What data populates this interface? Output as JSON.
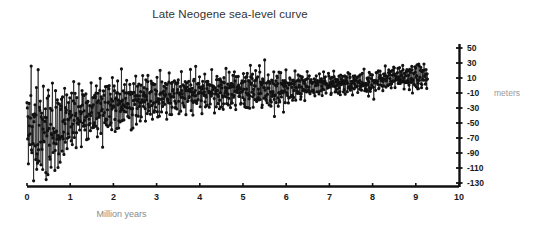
{
  "chart_data": {
    "type": "line",
    "title": "Late Neogene sea-level curve",
    "xlabel": "Million years",
    "ylabel": "meters",
    "xlim": [
      0,
      10
    ],
    "ylim": [
      -130,
      55
    ],
    "xticks": [
      0,
      1,
      2,
      3,
      4,
      5,
      6,
      7,
      8,
      9,
      10
    ],
    "xtick_labels": [
      "0",
      "1",
      "2",
      "3",
      "4",
      "5",
      "6",
      "7",
      "8",
      "9",
      "10"
    ],
    "yticks": [
      50,
      30,
      10,
      -10,
      -30,
      -50,
      -70,
      -90,
      -110,
      -130
    ],
    "ytick_labels": [
      "50",
      "30",
      "10",
      "-10",
      "-30",
      "-50",
      "-70",
      "-90",
      "-110",
      "-130"
    ],
    "grid": false,
    "legend": null,
    "series_color": "#111111",
    "marker": "circle",
    "marker_size": 1.6,
    "line_width": 0.7,
    "data_x_range": [
      0.0,
      9.27
    ],
    "envelope": [
      {
        "x": 0.0,
        "mean": -55,
        "amp": 72
      },
      {
        "x": 0.25,
        "mean": -58,
        "amp": 75
      },
      {
        "x": 0.5,
        "mean": -62,
        "amp": 70
      },
      {
        "x": 0.75,
        "mean": -58,
        "amp": 62
      },
      {
        "x": 1.0,
        "mean": -45,
        "amp": 50
      },
      {
        "x": 1.25,
        "mean": -40,
        "amp": 44
      },
      {
        "x": 1.5,
        "mean": -36,
        "amp": 42
      },
      {
        "x": 1.75,
        "mean": -30,
        "amp": 40
      },
      {
        "x": 2.0,
        "mean": -26,
        "amp": 38
      },
      {
        "x": 2.5,
        "mean": -20,
        "amp": 36
      },
      {
        "x": 3.0,
        "mean": -16,
        "amp": 34
      },
      {
        "x": 3.5,
        "mean": -10,
        "amp": 30
      },
      {
        "x": 4.0,
        "mean": -8,
        "amp": 30
      },
      {
        "x": 4.5,
        "mean": -8,
        "amp": 28
      },
      {
        "x": 5.0,
        "mean": -6,
        "amp": 28
      },
      {
        "x": 5.35,
        "mean": 0,
        "amp": 34
      },
      {
        "x": 5.75,
        "mean": -8,
        "amp": 30
      },
      {
        "x": 6.0,
        "mean": -4,
        "amp": 26
      },
      {
        "x": 6.5,
        "mean": 0,
        "amp": 18
      },
      {
        "x": 7.0,
        "mean": 2,
        "amp": 16
      },
      {
        "x": 7.5,
        "mean": 3,
        "amp": 16
      },
      {
        "x": 8.0,
        "mean": 2,
        "amp": 16
      },
      {
        "x": 8.3,
        "mean": 10,
        "amp": 16
      },
      {
        "x": 8.7,
        "mean": 12,
        "amp": 16
      },
      {
        "x": 9.0,
        "mean": 12,
        "amp": 22
      },
      {
        "x": 9.27,
        "mean": 10,
        "amp": 18
      }
    ]
  }
}
